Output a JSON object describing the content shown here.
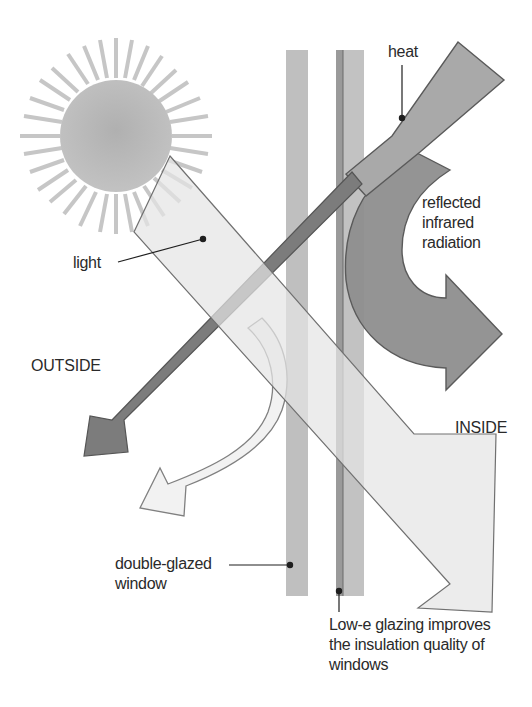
{
  "diagram": {
    "labels": {
      "heat": "heat",
      "reflected": "reflected\ninfrared\nradiation",
      "light": "light",
      "outside": "OUTSIDE",
      "inside": "INSIDE",
      "double_glazed": "double-glazed\nwindow",
      "low_e": "Low-e glazing improves\nthe insulation quality of\nwindows"
    },
    "elements": {
      "sun": "sun-icon",
      "light_arrow": "light-beam-arrow",
      "heat_arrow": "heat-arrow",
      "reflected_arrow": "reflected-infrared-arrow",
      "outgoing_heat_arrow": "outgoing-heat-arrow",
      "reflected_light_arrow": "reflected-light-arrow",
      "pane_outer": "outer-glass-pane",
      "pane_inner": "inner-glass-pane-low-e"
    },
    "colors": {
      "sun": "#b8b8b8",
      "rays": "#c4c4c4",
      "glass": "#bdbdbd",
      "heat": "#a8a8a8",
      "reflected": "#8f8f8f",
      "light": "#e6e6e6",
      "outgoing": "#7a7a7a",
      "stroke": "#6a6a6a",
      "text": "#2a2a2a"
    }
  }
}
